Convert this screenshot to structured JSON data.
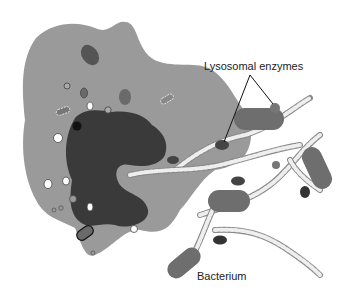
{
  "diagram": {
    "labels": {
      "lysosomal_enzymes": "Lysosomal enzymes",
      "bacterium": "Bacterium"
    },
    "colors": {
      "cytoplasm": "#9a9a9a",
      "nucleus": "#3a3a3a",
      "bacterium": "#6e6e6e",
      "enzyme": "#4a4a4a",
      "vesicle_white": "#ffffff",
      "dna_light": "#e8e8e8",
      "dna_dark": "#8a8a8a",
      "background": "#ffffff"
    }
  }
}
